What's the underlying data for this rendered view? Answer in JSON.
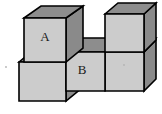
{
  "figure": {
    "canvas": {
      "width": 162,
      "height": 114,
      "background": "#ffffff"
    },
    "palette": {
      "top_face": "#8d8d8d",
      "front_face": "#cccccc",
      "side_face": "#8a8a8a",
      "outline": "#000000",
      "label_color": "#1a1a1a"
    },
    "labels": [
      {
        "name": "label-a",
        "text": "A",
        "x": 45,
        "y": 38
      },
      {
        "name": "label-b",
        "text": "B",
        "x": 82,
        "y": 71
      }
    ],
    "cubes": [
      {
        "id": "bottom-left-cube",
        "label": "",
        "front": "19,62 66,62 66,101 19,101",
        "top": "19,62 36,48 83,48 66,62",
        "side": "66,62 83,48 83,87 66,101"
      },
      {
        "id": "bottom-center-cube",
        "label": "B",
        "front": "66,52 105,52 105,91 66,91",
        "top": "66,52 83,38 122,38 105,52",
        "side": "105,52 122,38 122,77 105,91"
      },
      {
        "id": "bottom-right-cube",
        "label": "",
        "front": "105,52 144,52 144,91 105,91",
        "top": "105,52 122,38 144,38 144,52",
        "side": "144,52 156,40 156,79 144,91"
      },
      {
        "id": "top-left-cube",
        "label": "A",
        "front": "24,18 66,18 66,62 24,62",
        "top": "24,18 41,6 83,6 66,18",
        "side": "66,18 83,6 83,48 66,62"
      },
      {
        "id": "top-right-cube",
        "label": "",
        "front": "105,14 144,14 144,52 105,52",
        "top": "105,14 118,3 156,3 144,14",
        "side": "144,14 156,3 156,40 144,52"
      }
    ],
    "notch": {
      "name": "notch-gap",
      "description": "Empty space above the center cube between the two stacked cubes",
      "region": "83,6 105,6 105,38 83,38"
    }
  }
}
